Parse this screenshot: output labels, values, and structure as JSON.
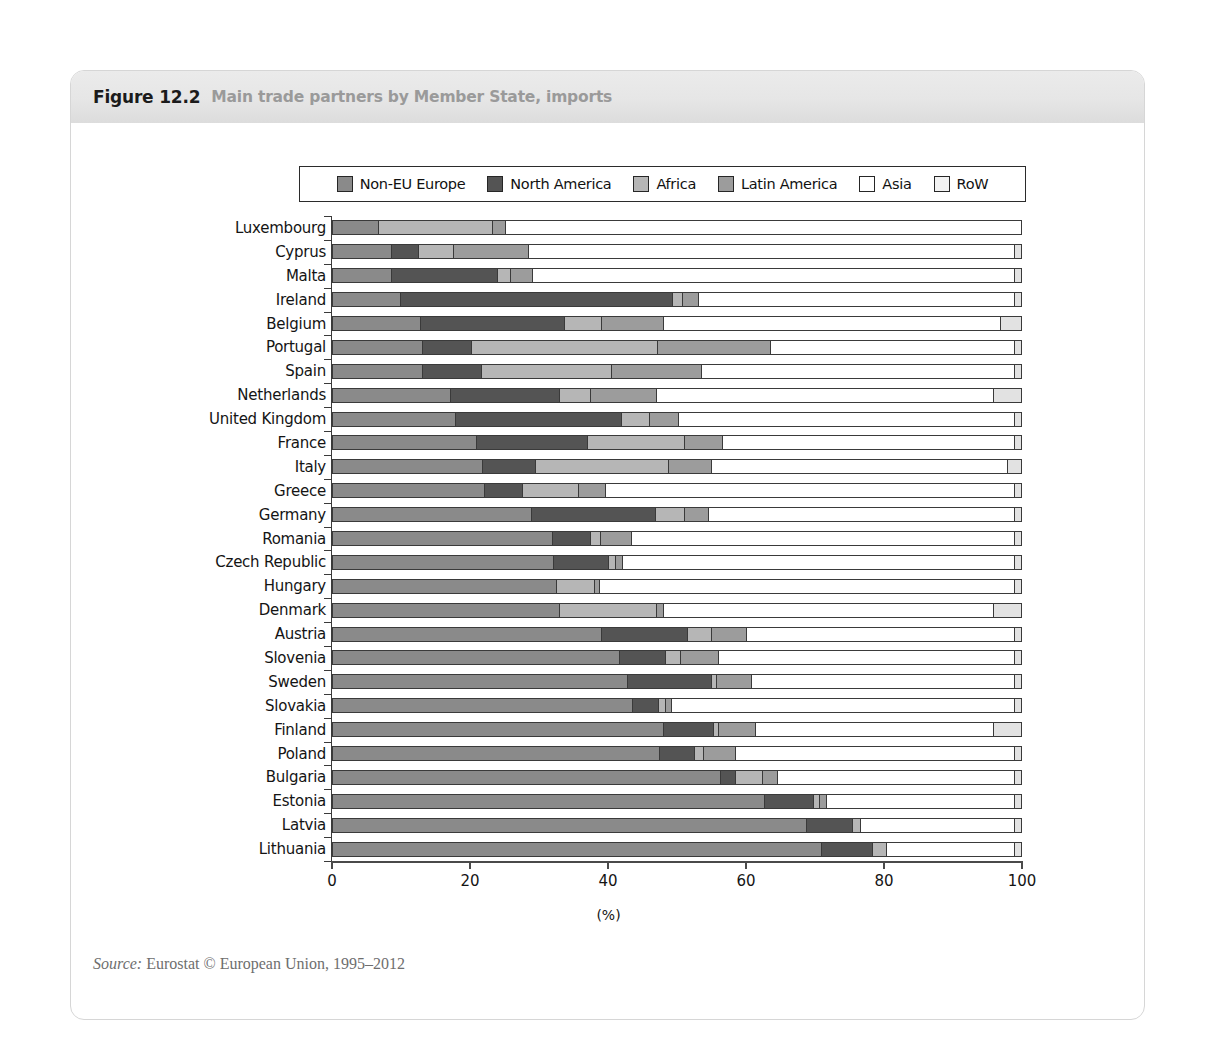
{
  "figure": {
    "number": "Figure 12.2",
    "title": "Main trade partners by Member State, imports",
    "source_prefix": "Source:",
    "source_text": "Eurostat © European Union, 1995–2012"
  },
  "chart_data": {
    "type": "bar",
    "orientation": "horizontal",
    "stacked": true,
    "title": "Main trade partners by Member State, imports",
    "xlabel": "(%)",
    "ylabel": "",
    "xlim": [
      0,
      100
    ],
    "xticks": [
      "0",
      "20",
      "40",
      "60",
      "80",
      "100"
    ],
    "grid": false,
    "legend_position": "top",
    "categories": [
      "Luxembourg",
      "Cyprus",
      "Malta",
      "Ireland",
      "Belgium",
      "Portugal",
      "Spain",
      "Netherlands",
      "United Kingdom",
      "France",
      "Italy",
      "Greece",
      "Germany",
      "Romania",
      "Czech Republic",
      "Hungary",
      "Denmark",
      "Austria",
      "Slovenia",
      "Sweden",
      "Slovakia",
      "Finland",
      "Poland",
      "Bulgaria",
      "Estonia",
      "Latvia",
      "Lithuania"
    ],
    "series": [
      {
        "name": "Non-EU Europe",
        "color": "#8a8a8a",
        "values": [
          6.6,
          8.4,
          8.4,
          9.7,
          12.7,
          12.9,
          13.0,
          17.0,
          17.7,
          20.8,
          21.6,
          22.0,
          28.8,
          31.9,
          32.0,
          32.4,
          32.8,
          38.9,
          41.5,
          42.8,
          43.4,
          47.9,
          47.4,
          56.3,
          62.6,
          68.7,
          71.0
        ]
      },
      {
        "name": "North America",
        "color": "#545454",
        "values": [
          0.0,
          3.9,
          15.4,
          39.6,
          20.9,
          7.1,
          8.5,
          15.8,
          24.2,
          16.1,
          7.7,
          5.5,
          18.0,
          5.5,
          8.0,
          0.0,
          0.0,
          12.5,
          6.7,
          12.2,
          3.9,
          7.3,
          5.1,
          2.2,
          7.1,
          6.7,
          7.4
        ]
      },
      {
        "name": "Africa",
        "color": "#b6b6b6",
        "values": [
          16.5,
          5.1,
          1.9,
          1.4,
          5.3,
          27.1,
          18.9,
          4.6,
          4.1,
          14.1,
          19.4,
          8.1,
          4.2,
          1.4,
          1.0,
          5.5,
          14.1,
          3.5,
          2.2,
          0.7,
          0.9,
          0.7,
          1.3,
          3.9,
          1.0,
          1.2,
          2.0
        ]
      },
      {
        "name": "Latin America",
        "color": "#9c9c9c",
        "values": [
          1.9,
          10.9,
          3.3,
          2.4,
          9.1,
          16.4,
          13.1,
          9.5,
          4.2,
          5.5,
          6.2,
          3.9,
          3.5,
          4.5,
          1.0,
          0.8,
          1.1,
          5.2,
          5.6,
          5.1,
          0.9,
          5.5,
          4.7,
          2.2,
          1.0,
          0.0,
          0.0
        ]
      },
      {
        "name": "Asia",
        "color": "#ffffff",
        "values": [
          75.0,
          70.7,
          70.0,
          45.9,
          48.9,
          35.5,
          45.5,
          49.1,
          48.8,
          42.5,
          43.1,
          59.5,
          44.5,
          55.7,
          57.0,
          60.3,
          48.0,
          38.9,
          43.0,
          38.2,
          49.9,
          34.6,
          40.5,
          34.4,
          27.3,
          22.4,
          18.6
        ]
      },
      {
        "name": "RoW",
        "color": "#e2e2e2",
        "values": [
          0.0,
          1.0,
          1.0,
          1.0,
          3.1,
          1.0,
          1.0,
          4.0,
          1.0,
          1.0,
          2.0,
          1.0,
          1.0,
          1.0,
          1.0,
          1.0,
          4.0,
          1.0,
          1.0,
          1.0,
          1.0,
          4.0,
          1.0,
          1.0,
          1.0,
          1.0,
          1.0
        ]
      }
    ]
  },
  "legend": {
    "items": [
      {
        "label": "Non-EU Europe",
        "color": "#8a8a8a"
      },
      {
        "label": "North America",
        "color": "#545454"
      },
      {
        "label": "Africa",
        "color": "#b6b6b6"
      },
      {
        "label": "Latin America",
        "color": "#9c9c9c"
      },
      {
        "label": "Asia",
        "color": "#ffffff"
      },
      {
        "label": "RoW",
        "color": "#f2f2f2"
      }
    ]
  }
}
